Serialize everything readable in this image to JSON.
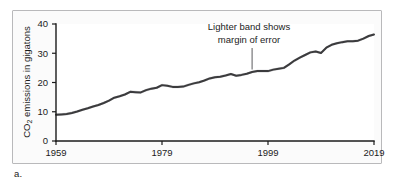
{
  "figure": {
    "caption": "a."
  },
  "annotation": {
    "line1": "Lighter band shows",
    "line2": "margin of error",
    "leader_target_year": 1996
  },
  "colors": {
    "line": "#3b3b3d",
    "band": "#b7b7b9",
    "axis": "#1b1b1b",
    "frame_border": "#b9b9bb",
    "frame_background": "#fbfbfb",
    "plot_background": "#ffffff"
  },
  "chart_data": {
    "type": "line",
    "title": "",
    "subtitle": "",
    "xlabel": "",
    "ylabel": "CO2 emissions in gigatons",
    "ylabel_parts": {
      "pre": "CO",
      "sub": "2",
      "post": " emissions in gigatons"
    },
    "xlim": [
      1959,
      2019
    ],
    "ylim": [
      0,
      40
    ],
    "xticks": [
      1959,
      1979,
      1999,
      2019
    ],
    "xticklabels": [
      "1959",
      "1979",
      "1999",
      "2019"
    ],
    "yticks": [
      0,
      10,
      20,
      30,
      40
    ],
    "yticklabels": [
      "0",
      "10",
      "20",
      "30",
      "40"
    ],
    "grid": false,
    "legend": false,
    "legend_position": "none",
    "annotations": [
      {
        "text": "Lighter band shows margin of error",
        "points_to_year": 1996,
        "points_to_value": 23.6
      }
    ],
    "series": [
      {
        "name": "CO2 emissions",
        "band_label": "margin of error",
        "band_halfwidth": 0.45,
        "x": [
          1959,
          1960,
          1961,
          1962,
          1963,
          1964,
          1965,
          1966,
          1967,
          1968,
          1969,
          1970,
          1971,
          1972,
          1973,
          1974,
          1975,
          1976,
          1977,
          1978,
          1979,
          1980,
          1981,
          1982,
          1983,
          1984,
          1985,
          1986,
          1987,
          1988,
          1989,
          1990,
          1991,
          1992,
          1993,
          1994,
          1995,
          1996,
          1997,
          1998,
          1999,
          2000,
          2001,
          2002,
          2003,
          2004,
          2005,
          2006,
          2007,
          2008,
          2009,
          2010,
          2011,
          2012,
          2013,
          2014,
          2015,
          2016,
          2017,
          2018,
          2019
        ],
        "values": [
          9.0,
          9.1,
          9.2,
          9.6,
          10.1,
          10.7,
          11.2,
          11.8,
          12.3,
          13.0,
          13.8,
          14.8,
          15.3,
          15.9,
          16.8,
          16.7,
          16.6,
          17.4,
          17.9,
          18.2,
          19.1,
          18.9,
          18.5,
          18.5,
          18.6,
          19.2,
          19.7,
          20.1,
          20.7,
          21.4,
          21.8,
          22.0,
          22.4,
          22.9,
          22.3,
          22.6,
          23.0,
          23.6,
          23.9,
          23.9,
          23.9,
          24.4,
          24.7,
          25.0,
          26.2,
          27.5,
          28.5,
          29.4,
          30.3,
          30.6,
          30.1,
          31.9,
          32.9,
          33.4,
          33.8,
          34.1,
          34.1,
          34.3,
          35.0,
          35.9,
          36.4
        ]
      }
    ]
  }
}
